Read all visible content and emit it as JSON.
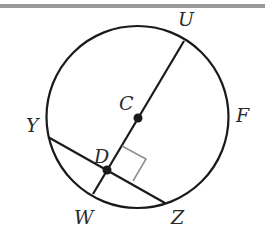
{
  "diagram": {
    "type": "circle-geometry",
    "circle": {
      "center_label": "C",
      "cx": 137.5,
      "cy": 117,
      "r": 91
    },
    "points": {
      "U": {
        "x": 184,
        "y": 41,
        "label": "U",
        "label_x": 178,
        "label_y": 26
      },
      "C": {
        "x": 138,
        "y": 118,
        "label": "C",
        "label_x": 120,
        "label_y": 110
      },
      "D": {
        "x": 107,
        "y": 170,
        "label": "D",
        "label_x": 95,
        "label_y": 163
      },
      "W": {
        "x": 93,
        "y": 194,
        "label": "W",
        "label_x": 76,
        "label_y": 224
      },
      "Y": {
        "x": 48,
        "y": 137,
        "label": "Y",
        "label_x": 27,
        "label_y": 132
      },
      "Z": {
        "x": 165,
        "y": 203,
        "label": "Z",
        "label_x": 170,
        "label_y": 224
      },
      "F": {
        "label": "F",
        "label_x": 236,
        "label_y": 122
      }
    },
    "segments": [
      "UW",
      "YZ"
    ],
    "right_angle_at": "D",
    "dot_points": [
      "C",
      "D"
    ],
    "colors": {
      "stroke": "#1a1a1a",
      "right_angle": "#8c8c8c",
      "topbar": "#9a9a9a"
    }
  }
}
